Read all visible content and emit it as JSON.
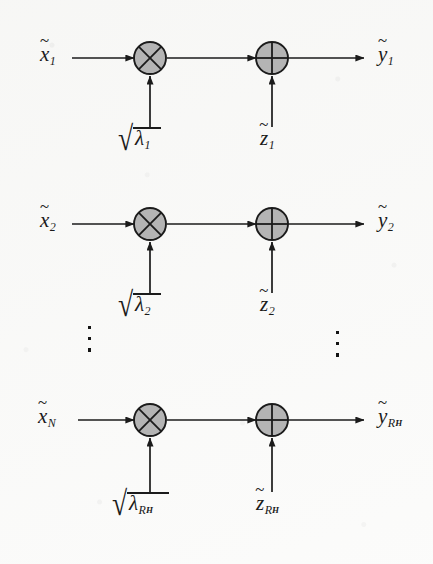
{
  "figure": {
    "type": "signal-flow-diagram",
    "background_color": "#fbfbfa",
    "ink_color": "#1b1b1b",
    "node_fill_color": "#b4b4b4",
    "node_stroke_color": "#1b1b1b",
    "symbols": {
      "multiply": "⊗",
      "add": "⊕",
      "tilde": "~",
      "radical": "√",
      "vertical_ellipsis": "⋮"
    },
    "branches": [
      {
        "id": "branch-1",
        "input_label": {
          "base": "x",
          "accent": "~",
          "sub": "1"
        },
        "gain_label": {
          "radical": "√",
          "base": "λ",
          "sub": "1"
        },
        "noise_label": {
          "base": "z",
          "accent": "~",
          "sub": "1"
        },
        "output_label": {
          "base": "y",
          "accent": "~",
          "sub": "1"
        },
        "multiplier_node": "⊗",
        "adder_node": "⊕"
      },
      {
        "id": "branch-2",
        "input_label": {
          "base": "x",
          "accent": "~",
          "sub": "2"
        },
        "gain_label": {
          "radical": "√",
          "base": "λ",
          "sub": "2"
        },
        "noise_label": {
          "base": "z",
          "accent": "~",
          "sub": "2"
        },
        "output_label": {
          "base": "y",
          "accent": "~",
          "sub": "2"
        },
        "multiplier_node": "⊗",
        "adder_node": "⊕"
      },
      {
        "id": "branch-N",
        "input_label": {
          "base": "x",
          "accent": "~",
          "sub": "N"
        },
        "gain_label": {
          "radical": "√",
          "base": "λ",
          "sub": "R",
          "subsub": "H"
        },
        "noise_label": {
          "base": "z",
          "accent": "~",
          "sub": "R",
          "subsub": "H"
        },
        "output_label": {
          "base": "y",
          "accent": "~",
          "sub": "R",
          "subsub": "H"
        },
        "multiplier_node": "⊗",
        "adder_node": "⊕"
      }
    ],
    "ellipses": [
      {
        "id": "ellipsis-left",
        "glyph": "⋮"
      },
      {
        "id": "ellipsis-right",
        "glyph": "⋮"
      }
    ]
  }
}
